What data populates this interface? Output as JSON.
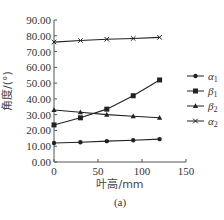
{
  "chart_data": {
    "type": "line",
    "title": "",
    "caption": "(a)",
    "xlabel": "叶高/mm",
    "ylabel": "角度/(°)",
    "xlim": [
      0,
      150
    ],
    "ylim": [
      0,
      90
    ],
    "x_ticks": [
      "0",
      "50",
      "100",
      "150"
    ],
    "y_ticks": [
      "0.00",
      "10.00",
      "20.00",
      "30.00",
      "40.00",
      "50.00",
      "60.00",
      "70.00",
      "80.00",
      "90.00"
    ],
    "grid": false,
    "legend_position": "right",
    "x": [
      0,
      30,
      60,
      90,
      120
    ],
    "series": [
      {
        "name": "α1",
        "marker": "diamond",
        "values": [
          12.0,
          12.5,
          13.2,
          13.8,
          14.5
        ]
      },
      {
        "name": "β1",
        "marker": "square",
        "values": [
          23.5,
          28.0,
          33.5,
          42.0,
          52.0
        ]
      },
      {
        "name": "β2",
        "marker": "triangle",
        "values": [
          33.0,
          31.5,
          30.0,
          29.0,
          28.0
        ]
      },
      {
        "name": "α2",
        "marker": "x",
        "values": [
          76.0,
          77.0,
          77.8,
          78.3,
          79.0
        ]
      }
    ]
  },
  "legend": {
    "items": [
      {
        "base": "α",
        "sub": "1"
      },
      {
        "base": "β",
        "sub": "1"
      },
      {
        "base": "β",
        "sub": "2"
      },
      {
        "base": "α",
        "sub": "2"
      }
    ]
  },
  "axes": {
    "xlabel": "叶高/mm",
    "ylabel": "角度/(°)",
    "caption": "(a)"
  }
}
